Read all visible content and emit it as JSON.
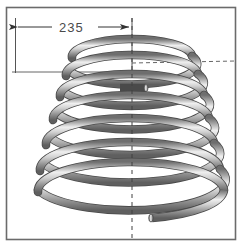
{
  "drawing": {
    "title": "Conical Coil Spring",
    "background_color": "#ffffff",
    "border": {
      "name": "drawing-frame",
      "color": "#6b6b6b",
      "x": 6,
      "y": 7,
      "width": 230,
      "height": 233
    },
    "dimension": {
      "label": "235",
      "text_color": "#4a4a4a",
      "line_color": "#555555",
      "leader_y": 27,
      "left_extension_x": 15,
      "right_extension_x": 132,
      "extension_top_y": 18,
      "extension_bottom_y": 73,
      "arrow_left_tip_x": 17,
      "arrow_right_tip_x": 130
    },
    "centerline": {
      "name": "vertical-centerline",
      "color": "#404040",
      "x": 132,
      "y_top": 18,
      "y_bottom": 238,
      "dash": "4 4"
    },
    "reference_lines": [
      {
        "name": "horizontal-reference-upper",
        "color": "#555555",
        "x1": 12,
        "y1": 72,
        "x2": 132,
        "y2": 72,
        "dash": "none"
      },
      {
        "name": "horizontal-reference-right-dashed",
        "color": "#555555",
        "x1": 132,
        "y1": 63,
        "x2": 236,
        "y2": 61,
        "dash": "4 3"
      }
    ],
    "spring": {
      "name": "conical-coil-spring",
      "type": "conical-helix",
      "turns": 6.75,
      "tube_color_light": "#f2f2f2",
      "tube_color_mid": "#b8b8b8",
      "tube_color_dark": "#6e6e6e",
      "outline_color": "#4a4a4a",
      "center_x": 132,
      "top_y": 52,
      "bottom_y": 218,
      "top_radius_x": 60,
      "bottom_radius_x": 94,
      "ellipse_ratio": 0.3,
      "tube_thickness": 7,
      "top_end_x": 140,
      "top_end_y": 88,
      "bottom_end_x": 150,
      "bottom_end_y": 218
    }
  }
}
